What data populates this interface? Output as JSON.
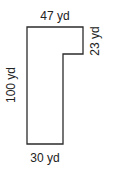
{
  "diagram": {
    "labels": {
      "top": "47 yd",
      "right_step": "23 yd",
      "left": "100 yd",
      "bottom": "30 yd"
    },
    "stroke_color": "#2b2b2b"
  }
}
